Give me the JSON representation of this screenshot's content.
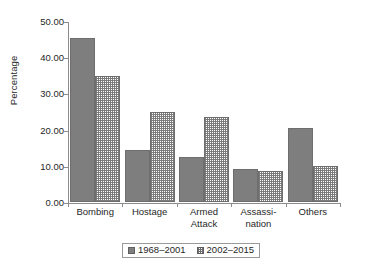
{
  "chart_data": {
    "type": "bar",
    "title": "",
    "subtitle": "",
    "xlabel": "",
    "ylabel": "Percentage",
    "categories": [
      "Bombing",
      "Hostage",
      "Armed\nAttack",
      "Assassi-\nnation",
      "Others"
    ],
    "series": [
      {
        "name": "1968–2001",
        "values": [
          45.2,
          14.5,
          12.3,
          9.1,
          20.4
        ],
        "fill": "solid-gray",
        "color": "#7e7e7e"
      },
      {
        "name": "2002–2015",
        "values": [
          34.7,
          24.9,
          23.6,
          8.7,
          9.9
        ],
        "fill": "checkerboard-hatch",
        "color": "#787878"
      }
    ],
    "ylim": [
      0,
      50
    ],
    "ytick_values": [
      0,
      10,
      20,
      30,
      40,
      50
    ],
    "ytick_labels": [
      "0.00",
      "10.00",
      "20.00",
      "30.00",
      "40.00",
      "50.00"
    ],
    "grid": false,
    "legend_position": "bottom",
    "annotations": []
  },
  "legend": {
    "entries": [
      {
        "label": "1968–2001"
      },
      {
        "label": "2002–2015"
      }
    ]
  },
  "axes": {
    "y_title": "Percentage"
  }
}
